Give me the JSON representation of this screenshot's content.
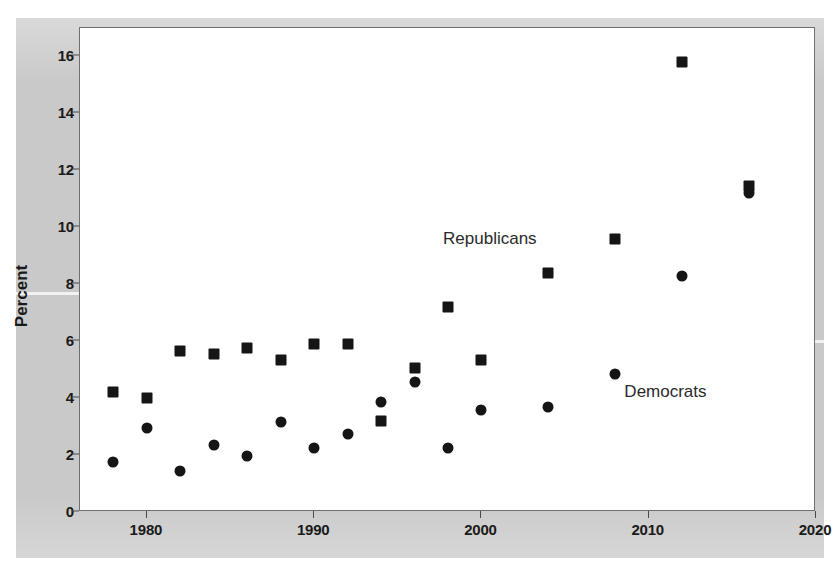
{
  "chart_data": {
    "type": "scatter",
    "title": "",
    "subtitle": "",
    "xlabel": "",
    "ylabel": "Percent",
    "xlim": [
      1976,
      2020
    ],
    "ylim": [
      0,
      17
    ],
    "xticks": [
      1980,
      1990,
      2000,
      2010,
      2020
    ],
    "yticks": [
      0,
      2,
      4,
      6,
      8,
      10,
      12,
      14,
      16
    ],
    "grid": false,
    "legend_position": "in-plot annotations",
    "annotations": [
      {
        "text": "Republicans",
        "x": 2000.5,
        "y": 9.6
      },
      {
        "text": "Democrats",
        "x": 2011.0,
        "y": 4.2
      }
    ],
    "x": [
      1978,
      1980,
      1982,
      1984,
      1986,
      1988,
      1990,
      1992,
      1994,
      1996,
      1998,
      2000,
      2004,
      2008,
      2012,
      2016
    ],
    "series": [
      {
        "name": "Republicans",
        "marker": "square",
        "color": "#151515",
        "values": [
          4.2,
          4.0,
          5.65,
          5.55,
          5.75,
          5.35,
          5.9,
          5.9,
          3.2,
          5.05,
          7.2,
          5.35,
          8.4,
          9.6,
          15.8,
          11.45
        ]
      },
      {
        "name": "Democrats",
        "marker": "circle",
        "color": "#151515",
        "values": [
          1.75,
          2.95,
          1.45,
          2.35,
          1.97,
          3.15,
          2.25,
          2.75,
          3.85,
          4.55,
          2.25,
          3.6,
          3.7,
          4.85,
          8.3,
          11.2
        ]
      }
    ]
  },
  "axis": {
    "y_label": "Percent",
    "y_tick_labels": [
      "0",
      "2",
      "4",
      "6",
      "8",
      "10",
      "12",
      "14",
      "16"
    ],
    "x_tick_labels": [
      "1980",
      "1990",
      "2000",
      "2010",
      "2020"
    ]
  }
}
